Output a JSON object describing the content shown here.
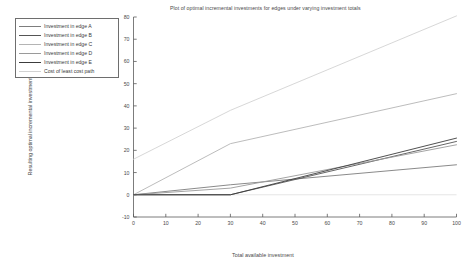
{
  "chart_data": {
    "type": "line",
    "title": "Plot of optimal incremental investments for edges under varying investment totals",
    "xlabel": "Total available investment",
    "ylabel": "Resulting optimal incremental investments",
    "xlim": [
      0,
      100
    ],
    "ylim": [
      -10,
      80
    ],
    "xticks": [
      0,
      10,
      20,
      30,
      40,
      50,
      60,
      70,
      80,
      90,
      100
    ],
    "yticks": [
      -10,
      0,
      10,
      20,
      30,
      40,
      50,
      60,
      70,
      80
    ],
    "grid": false,
    "legend_position": "upper-left-outside",
    "series": [
      {
        "name": "Investment in edge A",
        "color": "#7d7d7d",
        "x": [
          0,
          30,
          100
        ],
        "y": [
          0,
          4.5,
          13.5
        ]
      },
      {
        "name": "Investment in edge B",
        "color": "#555555",
        "x": [
          0,
          30,
          100
        ],
        "y": [
          0,
          0,
          24.0
        ]
      },
      {
        "name": "Investment in edge C",
        "color": "#b4b4b4",
        "x": [
          0,
          30,
          100
        ],
        "y": [
          0,
          23.0,
          45.5
        ]
      },
      {
        "name": "Investment in edge D",
        "color": "#9a9a9a",
        "x": [
          0,
          30,
          100
        ],
        "y": [
          0,
          3.0,
          22.5
        ]
      },
      {
        "name": "Investment in edge E",
        "color": "#3c3c3c",
        "x": [
          0,
          30,
          100
        ],
        "y": [
          0,
          0,
          25.5
        ]
      },
      {
        "name": "Cost of least cost path",
        "color": "#d2d2d2",
        "x": [
          0,
          30,
          100
        ],
        "y": [
          16.0,
          38.0,
          80.5
        ]
      }
    ],
    "zero_line": {
      "name": "zero-reference-line",
      "color": "#e2e2e2",
      "y": 0
    }
  },
  "legend": {
    "items": [
      {
        "label": "Investment in edge A"
      },
      {
        "label": "Investment in edge B"
      },
      {
        "label": "Investment in edge C"
      },
      {
        "label": "Investment in edge D"
      },
      {
        "label": "Investment in edge E"
      },
      {
        "label": "Cost of least cost path"
      }
    ]
  },
  "axes": {
    "x_tick_labels": [
      "0",
      "10",
      "20",
      "30",
      "40",
      "50",
      "60",
      "70",
      "80",
      "90",
      "100"
    ],
    "y_tick_labels": [
      "80",
      "70",
      "60",
      "50",
      "40",
      "30",
      "20",
      "10",
      "0",
      "-10"
    ]
  }
}
